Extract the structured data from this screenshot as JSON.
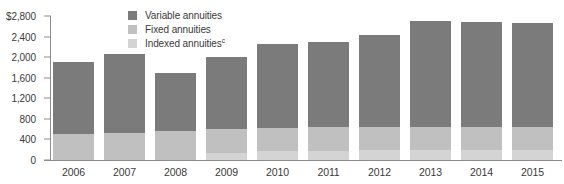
{
  "chart_data": {
    "type": "bar",
    "stacked": true,
    "title": "",
    "subtitle": "",
    "xlabel": "",
    "ylabel": "",
    "y_axis_prefix": "$",
    "categories": [
      "2006",
      "2007",
      "2008",
      "2009",
      "2010",
      "2011",
      "2012",
      "2013",
      "2014",
      "2015"
    ],
    "yticks": [
      0,
      400,
      800,
      1200,
      1600,
      2000,
      2400,
      2800
    ],
    "ytick_labels": [
      "0",
      "400",
      "800",
      "1,200",
      "1,600",
      "2,000",
      "2,400",
      "$2,800"
    ],
    "ylim": [
      0,
      2800
    ],
    "grid": false,
    "legend_position": "top-center",
    "series": [
      {
        "name": "Variable annuities",
        "color": "#7b7b7b",
        "values": [
          1390,
          1530,
          1125,
          1400,
          1640,
          1650,
          1800,
          2060,
          2040,
          2030
        ]
      },
      {
        "name": "Fixed annuities",
        "color": "#c0c0c0",
        "values": [
          510,
          530,
          565,
          480,
          450,
          470,
          450,
          440,
          440,
          440
        ]
      },
      {
        "name": "Indexed annuities",
        "color": "#d4d4d4",
        "values": [
          0,
          0,
          0,
          130,
          170,
          170,
          190,
          200,
          200,
          200
        ]
      }
    ],
    "totals": [
      1900,
      2060,
      1690,
      2010,
      2260,
      2290,
      2440,
      2700,
      2680,
      2670
    ]
  },
  "legend": {
    "items": [
      {
        "label": "Variable annuities",
        "superscript": "",
        "color": "#7b7b7b"
      },
      {
        "label": "Fixed annuities",
        "superscript": "",
        "color": "#c0c0c0"
      },
      {
        "label": "Indexed annuities",
        "superscript": "c",
        "color": "#d4d4d4"
      }
    ]
  }
}
